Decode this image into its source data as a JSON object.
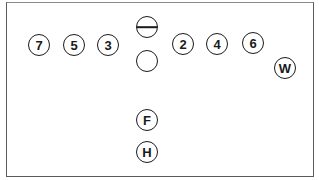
{
  "diagram": {
    "type": "football-formation",
    "colors": {
      "stroke": "#1a1a1a",
      "border": "#5a5a5a",
      "background": "#ffffff"
    },
    "players": [
      {
        "id": "p7",
        "label": "7",
        "x": 39,
        "y": 45,
        "kind": "numbered"
      },
      {
        "id": "p5",
        "label": "5",
        "x": 74,
        "y": 45,
        "kind": "numbered"
      },
      {
        "id": "p3",
        "label": "3",
        "x": 108,
        "y": 45,
        "kind": "numbered"
      },
      {
        "id": "center",
        "label": "",
        "x": 147,
        "y": 27,
        "kind": "center-line"
      },
      {
        "id": "empty",
        "label": "",
        "x": 147,
        "y": 61,
        "kind": "empty"
      },
      {
        "id": "p2",
        "label": "2",
        "x": 183,
        "y": 44,
        "kind": "numbered"
      },
      {
        "id": "p4",
        "label": "4",
        "x": 217,
        "y": 44,
        "kind": "numbered"
      },
      {
        "id": "p6",
        "label": "6",
        "x": 253,
        "y": 43,
        "kind": "numbered"
      },
      {
        "id": "pW",
        "label": "W",
        "x": 285,
        "y": 68,
        "kind": "lettered"
      },
      {
        "id": "pF",
        "label": "F",
        "x": 147,
        "y": 120,
        "kind": "lettered"
      },
      {
        "id": "pH",
        "label": "H",
        "x": 147,
        "y": 152,
        "kind": "lettered"
      }
    ]
  }
}
